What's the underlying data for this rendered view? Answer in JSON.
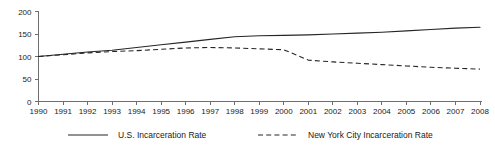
{
  "chart_data": {
    "type": "line",
    "title": "",
    "xlabel": "",
    "ylabel": "",
    "xlim": [
      1990,
      2008
    ],
    "ylim": [
      0,
      200
    ],
    "grid": false,
    "legend_position": "bottom",
    "yticks": [
      0,
      50,
      100,
      150,
      200
    ],
    "ytick_labels": [
      "0",
      "50",
      "100",
      "150",
      "200"
    ],
    "categories": [
      1990,
      1991,
      1992,
      1993,
      1994,
      1995,
      1996,
      1997,
      1998,
      1999,
      2000,
      2001,
      2002,
      2003,
      2004,
      2005,
      2006,
      2007,
      2008
    ],
    "xtick_labels": [
      "1990",
      "1991",
      "1992",
      "1993",
      "1994",
      "1995",
      "1996",
      "1997",
      "1998",
      "1999",
      "2000",
      "2001",
      "2002",
      "2003",
      "2004",
      "2005",
      "2006",
      "2007",
      "2008"
    ],
    "series": [
      {
        "name": "U.S. Incarceration Rate",
        "style": "solid",
        "color": "#262626",
        "values": [
          100,
          105,
          110,
          114,
          120,
          126,
          132,
          138,
          144,
          146,
          147,
          148,
          150,
          152,
          154,
          157,
          160,
          163,
          165
        ]
      },
      {
        "name": "New York City Incarceration Rate",
        "style": "dashed",
        "color": "#262626",
        "values": [
          100,
          104,
          108,
          111,
          113,
          116,
          119,
          120,
          119,
          117,
          115,
          92,
          88,
          85,
          82,
          79,
          76,
          74,
          72
        ]
      }
    ]
  },
  "legend": {
    "items": [
      {
        "label": "U.S. Incarceration Rate",
        "style": "solid"
      },
      {
        "label": "New York City Incarceration Rate",
        "style": "dashed"
      }
    ]
  }
}
